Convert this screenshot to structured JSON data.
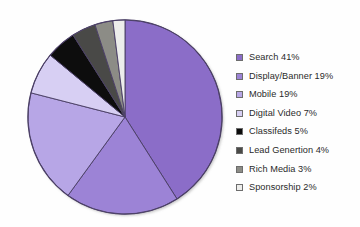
{
  "chart_data": {
    "type": "pie",
    "title": "",
    "subtitle": "",
    "xlabel": "",
    "ylabel": "",
    "legend_position": "right",
    "grid": false,
    "start_angle_deg": 0,
    "direction": "clockwise",
    "categories": [
      "Search",
      "Display/Banner",
      "Mobile",
      "Digital Video",
      "Classifeds",
      "Lead Genertion",
      "Rich Media",
      "Sponsorship"
    ],
    "values": [
      41,
      19,
      19,
      7,
      5,
      4,
      3,
      2
    ],
    "value_unit": "%",
    "colors": [
      "#8B6DC8",
      "#9C83D6",
      "#B7A6E6",
      "#D7CFF3",
      "#0B0B0B",
      "#4A4A47",
      "#8C8C86",
      "#EDEDEB"
    ],
    "slice_border_color": "#4b3f66",
    "legend_entries": [
      {
        "label": "Search 41%",
        "swatch": "#8B6DC8"
      },
      {
        "label": "Display/Banner 19%",
        "swatch": "#9C83D6"
      },
      {
        "label": "Mobile 19%",
        "swatch": "#B7A6E6"
      },
      {
        "label": "Digital Video 7%",
        "swatch": "#D7CFF3"
      },
      {
        "label": "Classifeds 5%",
        "swatch": "#0B0B0B"
      },
      {
        "label": "Lead Genertion 4%",
        "swatch": "#4A4A47"
      },
      {
        "label": "Rich Media 3%",
        "swatch": "#8C8C86"
      },
      {
        "label": "Sponsorship 2%",
        "swatch": "#EDEDEB"
      }
    ]
  },
  "background_color": "#fefefe"
}
